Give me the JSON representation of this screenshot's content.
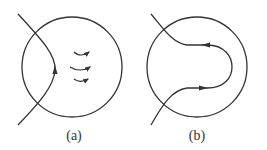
{
  "figure": {
    "stroke_color": "#333333",
    "background": "#ffffff",
    "panels": [
      {
        "id": "a",
        "label": "(a)",
        "circle": {
          "cx": 72,
          "cy": 67,
          "r": 50
        },
        "curve": "crossing curve entering top-left, bending inward to the right, exiting bottom-left",
        "curve_arrow": "upward arrow on curve at leftmost inner point",
        "field_arrows": [
          "right-pointing curved arrow",
          "right-pointing curved arrow",
          "right-pointing curved arrow"
        ]
      },
      {
        "id": "b",
        "label": "(b)",
        "circle": {
          "cx": 197,
          "cy": 67,
          "r": 50
        },
        "curve": "curve entering top-left, looping inside circle to the right and back, exiting bottom-left",
        "curve_arrows": [
          "left-pointing arrow on upper branch",
          "right-pointing arrow on lower branch"
        ]
      }
    ]
  }
}
